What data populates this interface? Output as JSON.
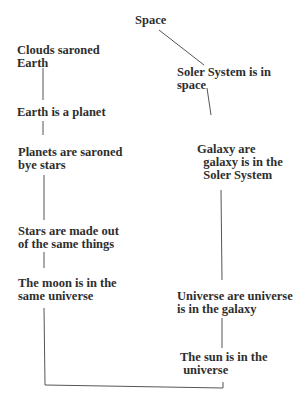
{
  "diagram": {
    "type": "concept-map",
    "colors": {
      "background": "#ffffff",
      "text": "#2e2e2e",
      "lines": "#555555"
    },
    "root": {
      "label": "Space"
    },
    "left_branch": [
      {
        "label": "Clouds saroned\nEarth"
      },
      {
        "label": "Earth is a planet"
      },
      {
        "label": "Planets are saroned\nbye stars"
      },
      {
        "label": "Stars are made out\nof the same things"
      },
      {
        "label": "The moon is in the\nsame universe"
      }
    ],
    "right_branch": [
      {
        "label": "Soler System is in\nspace"
      },
      {
        "label": "Galaxy are\n  galaxy is in the\n  Soler System"
      },
      {
        "label": "Universe are universe\nis in the galaxy"
      },
      {
        "label": "The sun is in the\n universe"
      }
    ]
  }
}
